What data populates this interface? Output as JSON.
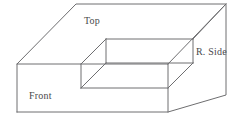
{
  "figure": {
    "projection": "oblique",
    "stroke_color": "#6e6e70",
    "fill_color": "#ffffff",
    "background_color": "#ffffff",
    "label_color": "#4a4a4c",
    "labels": {
      "top": "Top",
      "right_side": "R. Side",
      "front": "Front"
    },
    "geometry": {
      "front_face": "17,64 168,64 168,112 17,112",
      "top_face": "17,64 76,4 226,4 193,39 106,39 81,64",
      "right_face": "168,64 193,39 193,39 226,4 226,95 168,112",
      "notch_back_wall": "106,39 193,39 193,63 106,63",
      "notch_floor": "106,63 193,63 168,88 81,88",
      "notch_left_wall": "106,39 106,63 81,88 81,64",
      "step_riser_front": "81,64 81,88 168,88 168,64",
      "outer_top_back_edge": "76,4 226,4",
      "outer_right_vertical": "226,4 226,95",
      "outer_left_diagonal": "17,64 76,4",
      "front_bottom_edge": "17,112 168,112",
      "front_left_vertical": "17,64 17,112",
      "bottom_right_diagonal": "168,112 226,95"
    }
  }
}
